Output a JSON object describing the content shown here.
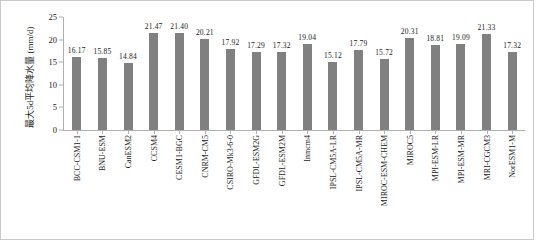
{
  "chart_data": {
    "type": "bar",
    "title": "",
    "xlabel": "",
    "ylabel": "最大5d平均降水量 (mm/d)",
    "ylim": [
      0,
      25
    ],
    "yticks": [
      0,
      5,
      10,
      15,
      20,
      25
    ],
    "grid": false,
    "legend": "none",
    "bar_color": "#808080",
    "categories": [
      "BCC-CSM1-1",
      "BNU-ESM",
      "CanESM2",
      "CCSM4",
      "CESM1-BGC",
      "CNRM-CM5",
      "CSIRO-Mk3-6-0",
      "GFDL-ESM2G",
      "GFDL-ESM2M",
      "Inmcm4",
      "IPSL-CM5A-LR",
      "IPSL-CM5A-MR",
      "MIROC-ESM-CHEM",
      "MIROC5",
      "MPI-ESM-LR",
      "MPI-ESM-MR",
      "MRI-CGCM3",
      "NorESM1-M"
    ],
    "values": [
      16.17,
      15.85,
      14.84,
      21.47,
      21.4,
      20.21,
      17.92,
      17.29,
      17.32,
      19.04,
      15.12,
      17.79,
      15.72,
      20.31,
      18.81,
      19.09,
      21.33,
      17.32
    ],
    "value_labels": [
      "16.17",
      "15.85",
      "14.84",
      "21.47",
      "21.40",
      "20.21",
      "17.92",
      "17.29",
      "17.32",
      "19.04",
      "15.12",
      "17.79",
      "15.72",
      "20.31",
      "18.81",
      "19.09",
      "21.33",
      "17.32"
    ],
    "ytick_labels": [
      "0",
      "5",
      "10",
      "15",
      "20",
      "25"
    ]
  }
}
